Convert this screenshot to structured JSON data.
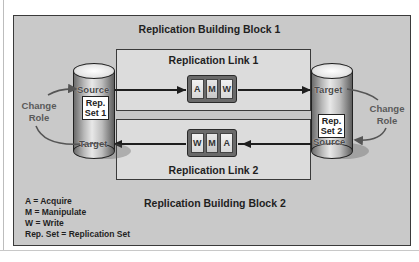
{
  "diagram": {
    "block1_title": "Replication Building Block 1",
    "block2_title": "Replication Building Block 2",
    "link1": {
      "title": "Replication Link 1",
      "steps": [
        "A",
        "M",
        "W"
      ],
      "direction": "left-to-right"
    },
    "link2": {
      "title": "Replication Link 2",
      "steps": [
        "W",
        "M",
        "A"
      ],
      "direction": "right-to-left"
    },
    "left_store": {
      "top_role": "Source",
      "label_line1": "Rep.",
      "label_line2": "Set 1",
      "bottom_role": "Target",
      "change_role_line1": "Change",
      "change_role_line2": "Role"
    },
    "right_store": {
      "top_role": "Target",
      "label_line1": "Rep.",
      "label_line2": "Set 2",
      "bottom_role": "Source",
      "change_role_line1": "Change",
      "change_role_line2": "Role"
    },
    "legend": [
      "A = Acquire",
      "M = Manipulate",
      "W = Write",
      "Rep. Set = Replication Set"
    ],
    "colors": {
      "outer_bg": "#c9c9c9",
      "inner_bg": "#dcdcdc",
      "border": "#3a3a3a",
      "role_text": "#5a5a5a"
    }
  }
}
